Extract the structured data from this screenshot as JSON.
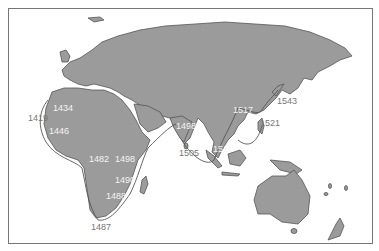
{
  "map": {
    "title": "Portuguese voyages of exploration",
    "colors": {
      "land": "#9b9b9b",
      "coast": "#555555",
      "route": "#555555",
      "water": "#ffffff",
      "frame": "#777777"
    },
    "labels": [
      {
        "id": "y1419",
        "text": "1419",
        "x": 28,
        "y": 114,
        "style": "out"
      },
      {
        "id": "y1434",
        "text": "1434",
        "x": 53,
        "y": 104,
        "style": "in"
      },
      {
        "id": "y1446",
        "text": "1446",
        "x": 49,
        "y": 127,
        "style": "in"
      },
      {
        "id": "y1482",
        "text": "1482",
        "x": 89,
        "y": 155,
        "style": "in"
      },
      {
        "id": "y1498a",
        "text": "1498",
        "x": 115,
        "y": 155,
        "style": "in"
      },
      {
        "id": "y1490",
        "text": "1490",
        "x": 115,
        "y": 176,
        "style": "in"
      },
      {
        "id": "y1488",
        "text": "1488",
        "x": 106,
        "y": 192,
        "style": "in"
      },
      {
        "id": "y1487",
        "text": "1487",
        "x": 91,
        "y": 223,
        "style": "out"
      },
      {
        "id": "y1498b",
        "text": "1498",
        "x": 176,
        "y": 122,
        "style": "in"
      },
      {
        "id": "y1505",
        "text": "1505",
        "x": 179,
        "y": 149,
        "style": "out"
      },
      {
        "id": "y1511",
        "text": "1511",
        "x": 213,
        "y": 145,
        "style": "in"
      },
      {
        "id": "y1517",
        "text": "1517",
        "x": 233,
        "y": 106,
        "style": "in"
      },
      {
        "id": "y1521",
        "text": "1521",
        "x": 260,
        "y": 119,
        "style": "out"
      },
      {
        "id": "y1543",
        "text": "1543",
        "x": 277,
        "y": 97,
        "style": "out"
      }
    ]
  }
}
